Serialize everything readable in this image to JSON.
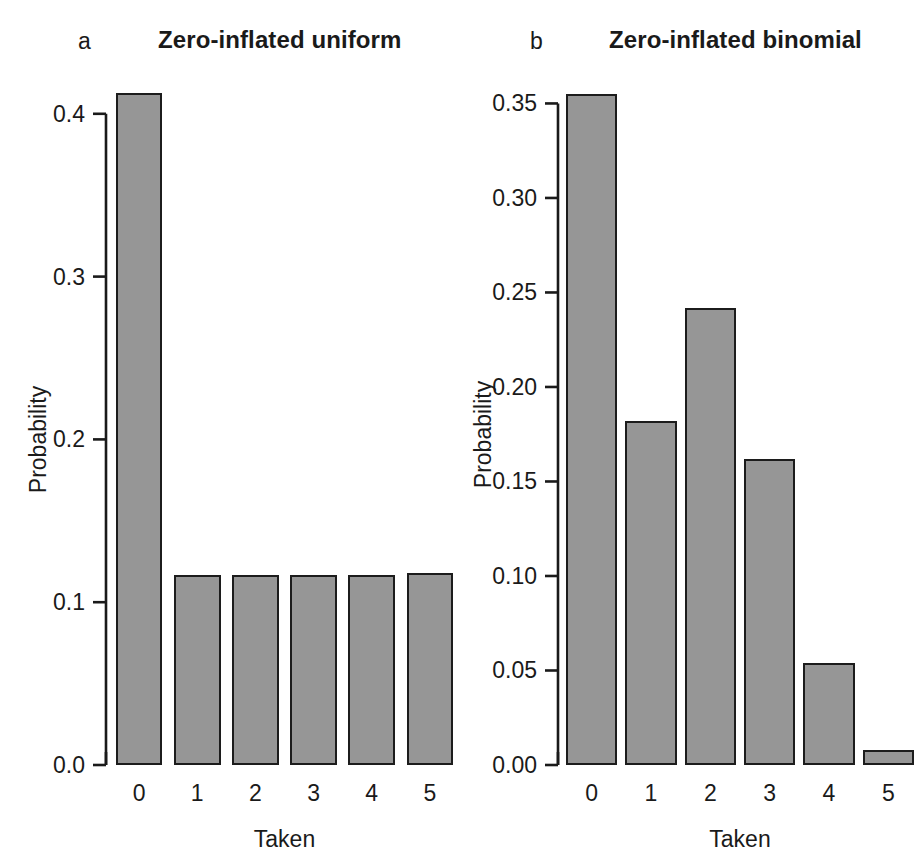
{
  "figure": {
    "background": "#ffffff",
    "bar_fill": "#969696",
    "bar_border": "#1c1c1c",
    "axis_color": "#1a1a1a"
  },
  "panels": [
    {
      "label": "a",
      "title": "Zero-inflated uniform",
      "xlabel": "Taken",
      "ylabel": "Probability"
    },
    {
      "label": "b",
      "title": "Zero-inflated binomial",
      "xlabel": "Taken",
      "ylabel": "Probability"
    }
  ],
  "chart_data": [
    {
      "type": "bar",
      "title": "Zero-inflated uniform",
      "panel_label": "a",
      "xlabel": "Taken",
      "ylabel": "Probability",
      "categories": [
        "0",
        "1",
        "2",
        "3",
        "4",
        "5"
      ],
      "values": [
        0.413,
        0.117,
        0.117,
        0.117,
        0.117,
        0.118
      ],
      "ylim": [
        0.0,
        0.42
      ],
      "yticks": [
        0.0,
        0.1,
        0.2,
        0.3,
        0.4
      ],
      "ytick_labels": [
        "0.0",
        "0.1",
        "0.2",
        "0.3",
        "0.4"
      ],
      "grid": false,
      "legend": null
    },
    {
      "type": "bar",
      "title": "Zero-inflated binomial",
      "panel_label": "b",
      "xlabel": "Taken",
      "ylabel": "Probability",
      "categories": [
        "0",
        "1",
        "2",
        "3",
        "4",
        "5"
      ],
      "values": [
        0.355,
        0.182,
        0.242,
        0.162,
        0.054,
        0.008
      ],
      "ylim": [
        0.0,
        0.36
      ],
      "yticks": [
        0.0,
        0.05,
        0.1,
        0.15,
        0.2,
        0.25,
        0.3,
        0.35
      ],
      "ytick_labels": [
        "0.00",
        "0.05",
        "0.10",
        "0.15",
        "0.20",
        "0.25",
        "0.30",
        "0.35"
      ],
      "grid": false,
      "legend": null
    }
  ]
}
